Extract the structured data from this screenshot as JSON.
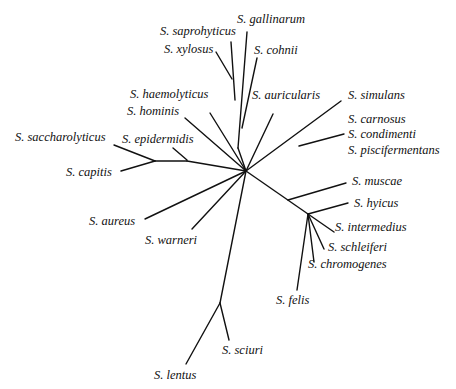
{
  "tree": {
    "type": "unrooted-phylogenetic-tree",
    "line_color": "#111111",
    "taxa": [
      {
        "label": "S. saprohyticus",
        "x": 160,
        "y": 24
      },
      {
        "label": "S. gallinarum",
        "x": 237,
        "y": 12
      },
      {
        "label": "S. xylosus",
        "x": 164,
        "y": 42
      },
      {
        "label": "S. cohnii",
        "x": 254,
        "y": 43
      },
      {
        "label": "S. haemolyticus",
        "x": 130,
        "y": 87
      },
      {
        "label": "S. auricularis",
        "x": 252,
        "y": 88
      },
      {
        "label": "S. simulans",
        "x": 348,
        "y": 88
      },
      {
        "label": "S. hominis",
        "x": 127,
        "y": 104
      },
      {
        "label": "S. carnosus",
        "x": 348,
        "y": 112
      },
      {
        "label": "S. saccharolyticus",
        "x": 15,
        "y": 130
      },
      {
        "label": "S. epidermidis",
        "x": 122,
        "y": 132
      },
      {
        "label": "S. condimenti",
        "x": 348,
        "y": 127
      },
      {
        "label": "S. piscifermentans",
        "x": 348,
        "y": 143
      },
      {
        "label": "S. capitis",
        "x": 66,
        "y": 165
      },
      {
        "label": "S. muscae",
        "x": 352,
        "y": 174
      },
      {
        "label": "S. hyicus",
        "x": 354,
        "y": 196
      },
      {
        "label": "S. aureus",
        "x": 89,
        "y": 214
      },
      {
        "label": "S. intermedius",
        "x": 335,
        "y": 220
      },
      {
        "label": "S. warneri",
        "x": 145,
        "y": 233
      },
      {
        "label": "S. schleiferi",
        "x": 328,
        "y": 240
      },
      {
        "label": "S. chromogenes",
        "x": 308,
        "y": 257
      },
      {
        "label": "S. felis",
        "x": 276,
        "y": 293
      },
      {
        "label": "S. sciuri",
        "x": 222,
        "y": 343
      },
      {
        "label": "S. lentus",
        "x": 154,
        "y": 368
      }
    ]
  }
}
